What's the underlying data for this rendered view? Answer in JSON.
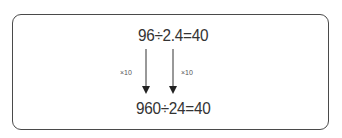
{
  "diagram": {
    "top_equation": "96÷2.4=40",
    "bottom_equation": "960÷24=40",
    "arrows": [
      {
        "label": "×10",
        "from": "96",
        "to": "960"
      },
      {
        "label": "×10",
        "from": "2.4",
        "to": "24"
      }
    ],
    "colors": {
      "border": "#4a4a4a",
      "text": "#333333",
      "arrow": "#333333"
    }
  }
}
